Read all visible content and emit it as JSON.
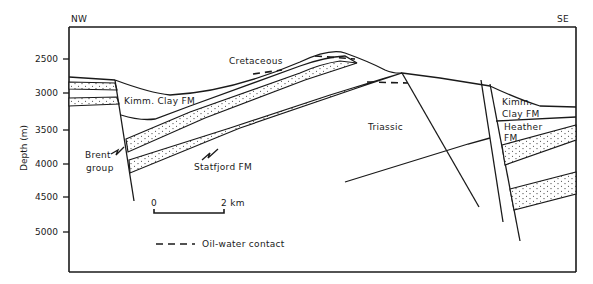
{
  "figure": {
    "orientation": {
      "left": "NW",
      "right": "SE"
    },
    "y_axis": {
      "label": "Depth (m)",
      "ticks": [
        "2500",
        "3000",
        "3500",
        "4000",
        "4500",
        "5000"
      ]
    },
    "units": [
      {
        "name": "cretaceous",
        "label": "Cretaceous"
      },
      {
        "name": "kimm-clay-left",
        "label": "Kimm. Clay FM"
      },
      {
        "name": "triassic",
        "label": "Triassic"
      },
      {
        "name": "brent-group",
        "label_line1": "Brent",
        "label_line2": "group"
      },
      {
        "name": "statfjord",
        "label": "Statfjord FM"
      },
      {
        "name": "kimm-clay-right",
        "label_line1": "Kimm.",
        "label_line2": "Clay FM"
      },
      {
        "name": "heather",
        "label_line1": "Heather",
        "label_line2": "FM"
      }
    ],
    "scale_bar": {
      "start": "0",
      "end": "2 km"
    },
    "legend": {
      "oil_water_contact": "Oil-water contact"
    }
  }
}
